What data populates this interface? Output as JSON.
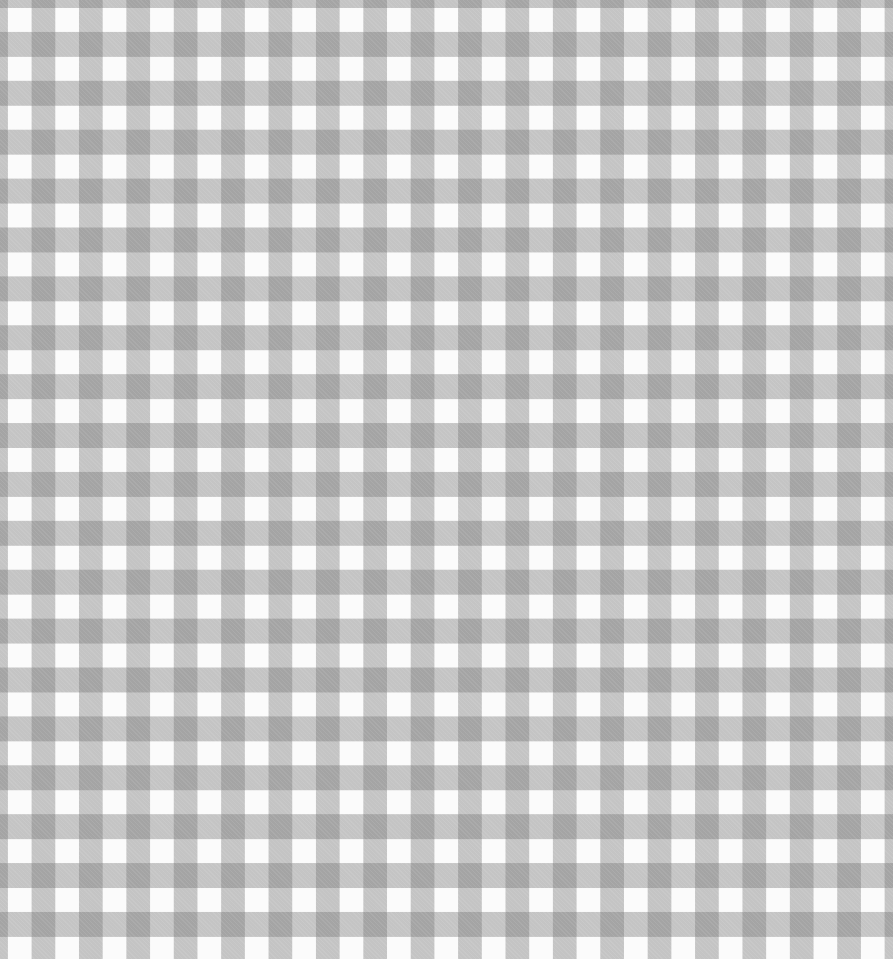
{
  "image": {
    "description": "Grey and white gingham check fabric pattern",
    "pattern": "gingham",
    "colors": {
      "white": "#fbfbfb",
      "band": "#c4c4c4",
      "intersection": "#9a9a9a"
    },
    "period_px": {
      "horizontal": 47.4,
      "vertical": 48.9
    },
    "band_width_px": 24
  }
}
